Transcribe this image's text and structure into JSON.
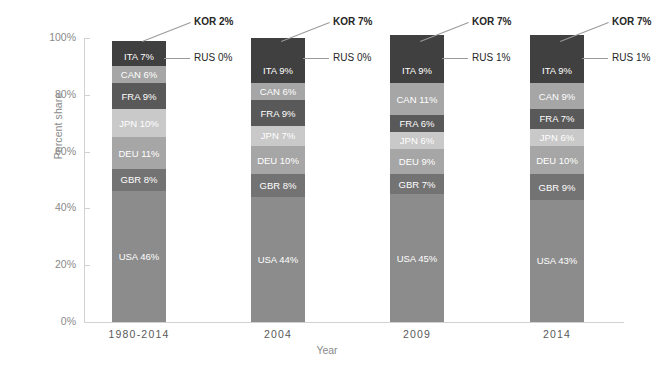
{
  "chart_data": {
    "type": "bar",
    "subtype": "stacked-percent",
    "title": "",
    "xlabel": "Year",
    "ylabel": "Percent share",
    "ylim": [
      0,
      100
    ],
    "yticks": [
      "0%",
      "20%",
      "40%",
      "60%",
      "80%",
      "100%"
    ],
    "ytick_values": [
      0,
      20,
      40,
      60,
      80,
      100
    ],
    "grid": false,
    "legend": "none (in-bar data labels)",
    "categories": [
      "1980-2014",
      "2004",
      "2009",
      "2014"
    ],
    "stack_order_bottom_to_top": [
      "USA",
      "GBR",
      "DEU",
      "JPN",
      "FRA",
      "CAN",
      "ITA",
      "RUS",
      "KOR"
    ],
    "series": [
      {
        "name": "USA",
        "values": [
          46,
          44,
          45,
          43
        ]
      },
      {
        "name": "GBR",
        "values": [
          8,
          8,
          7,
          9
        ]
      },
      {
        "name": "DEU",
        "values": [
          11,
          10,
          9,
          10
        ]
      },
      {
        "name": "JPN",
        "values": [
          10,
          7,
          6,
          6
        ]
      },
      {
        "name": "FRA",
        "values": [
          9,
          9,
          6,
          7
        ]
      },
      {
        "name": "CAN",
        "values": [
          6,
          6,
          11,
          9
        ]
      },
      {
        "name": "ITA",
        "values": [
          7,
          9,
          9,
          9
        ]
      },
      {
        "name": "RUS",
        "values": [
          0,
          0,
          1,
          1
        ]
      },
      {
        "name": "KOR",
        "values": [
          2,
          7,
          7,
          7
        ]
      }
    ],
    "bars": [
      {
        "category": "1980-2014",
        "segments": [
          {
            "code": "USA",
            "value": 46,
            "label": "USA 46%",
            "color": "#8c8c8c",
            "hatch": true,
            "inside": true
          },
          {
            "code": "GBR",
            "value": 8,
            "label": "GBR 8%",
            "color": "#737373",
            "hatch": false,
            "inside": true
          },
          {
            "code": "DEU",
            "value": 11,
            "label": "DEU 11%",
            "color": "#a6a6a6",
            "hatch": false,
            "inside": true
          },
          {
            "code": "JPN",
            "value": 10,
            "label": "JPN 10%",
            "color": "#c9c9c9",
            "hatch": false,
            "inside": true
          },
          {
            "code": "FRA",
            "value": 9,
            "label": "FRA 9%",
            "color": "#595959",
            "hatch": false,
            "inside": true
          },
          {
            "code": "CAN",
            "value": 6,
            "label": "CAN 6%",
            "color": "#a6a6a6",
            "hatch": false,
            "inside": true
          },
          {
            "code": "ITA",
            "value": 7,
            "label": "ITA 7%",
            "color": "#404040",
            "hatch": false,
            "inside": true
          },
          {
            "code": "RUS",
            "value": 0,
            "label": "RUS 0%",
            "color": "#404040",
            "hatch": false,
            "inside": false
          },
          {
            "code": "KOR",
            "value": 2,
            "label": "KOR 2%",
            "color": "#404040",
            "hatch": false,
            "inside": false
          }
        ],
        "callouts": [
          {
            "code": "KOR",
            "label": "KOR 2%",
            "bold": true
          },
          {
            "code": "RUS",
            "label": "RUS 0%",
            "bold": false
          }
        ]
      },
      {
        "category": "2004",
        "segments": [
          {
            "code": "USA",
            "value": 44,
            "label": "USA 44%",
            "color": "#8c8c8c",
            "hatch": true,
            "inside": true
          },
          {
            "code": "GBR",
            "value": 8,
            "label": "GBR 8%",
            "color": "#737373",
            "hatch": false,
            "inside": true
          },
          {
            "code": "DEU",
            "value": 10,
            "label": "DEU 10%",
            "color": "#a6a6a6",
            "hatch": false,
            "inside": true
          },
          {
            "code": "JPN",
            "value": 7,
            "label": "JPN 7%",
            "color": "#c9c9c9",
            "hatch": false,
            "inside": true
          },
          {
            "code": "FRA",
            "value": 9,
            "label": "FRA 9%",
            "color": "#595959",
            "hatch": false,
            "inside": true
          },
          {
            "code": "CAN",
            "value": 6,
            "label": "CAN 6%",
            "color": "#a6a6a6",
            "hatch": false,
            "inside": true
          },
          {
            "code": "ITA",
            "value": 9,
            "label": "ITA 9%",
            "color": "#404040",
            "hatch": false,
            "inside": true
          },
          {
            "code": "RUS",
            "value": 0,
            "label": "RUS 0%",
            "color": "#404040",
            "hatch": false,
            "inside": false
          },
          {
            "code": "KOR",
            "value": 7,
            "label": "KOR 7%",
            "color": "#404040",
            "hatch": false,
            "inside": false
          }
        ],
        "callouts": [
          {
            "code": "KOR",
            "label": "KOR 7%",
            "bold": true
          },
          {
            "code": "RUS",
            "label": "RUS 0%",
            "bold": false
          }
        ]
      },
      {
        "category": "2009",
        "segments": [
          {
            "code": "USA",
            "value": 45,
            "label": "USA 45%",
            "color": "#8c8c8c",
            "hatch": true,
            "inside": true
          },
          {
            "code": "GBR",
            "value": 7,
            "label": "GBR 7%",
            "color": "#737373",
            "hatch": false,
            "inside": true
          },
          {
            "code": "DEU",
            "value": 9,
            "label": "DEU 9%",
            "color": "#a6a6a6",
            "hatch": false,
            "inside": true
          },
          {
            "code": "JPN",
            "value": 6,
            "label": "JPN 6%",
            "color": "#c9c9c9",
            "hatch": false,
            "inside": true
          },
          {
            "code": "FRA",
            "value": 6,
            "label": "FRA 6%",
            "color": "#595959",
            "hatch": false,
            "inside": true
          },
          {
            "code": "CAN",
            "value": 11,
            "label": "CAN 11%",
            "color": "#a6a6a6",
            "hatch": false,
            "inside": true
          },
          {
            "code": "ITA",
            "value": 9,
            "label": "ITA 9%",
            "color": "#404040",
            "hatch": false,
            "inside": true
          },
          {
            "code": "RUS",
            "value": 1,
            "label": "RUS 1%",
            "color": "#404040",
            "hatch": false,
            "inside": false
          },
          {
            "code": "KOR",
            "value": 7,
            "label": "KOR 7%",
            "color": "#404040",
            "hatch": false,
            "inside": false
          }
        ],
        "callouts": [
          {
            "code": "KOR",
            "label": "KOR 7%",
            "bold": true
          },
          {
            "code": "RUS",
            "label": "RUS 1%",
            "bold": false
          }
        ]
      },
      {
        "category": "2014",
        "segments": [
          {
            "code": "USA",
            "value": 43,
            "label": "USA 43%",
            "color": "#8c8c8c",
            "hatch": true,
            "inside": true
          },
          {
            "code": "GBR",
            "value": 9,
            "label": "GBR 9%",
            "color": "#737373",
            "hatch": false,
            "inside": true
          },
          {
            "code": "DEU",
            "value": 10,
            "label": "DEU 10%",
            "color": "#a6a6a6",
            "hatch": false,
            "inside": true
          },
          {
            "code": "JPN",
            "value": 6,
            "label": "JPN 6%",
            "color": "#c9c9c9",
            "hatch": false,
            "inside": true
          },
          {
            "code": "FRA",
            "value": 7,
            "label": "FRA 7%",
            "color": "#595959",
            "hatch": false,
            "inside": true
          },
          {
            "code": "CAN",
            "value": 9,
            "label": "CAN 9%",
            "color": "#a6a6a6",
            "hatch": false,
            "inside": true
          },
          {
            "code": "ITA",
            "value": 9,
            "label": "ITA 9%",
            "color": "#404040",
            "hatch": false,
            "inside": true
          },
          {
            "code": "RUS",
            "value": 1,
            "label": "RUS 1%",
            "color": "#404040",
            "hatch": false,
            "inside": false
          },
          {
            "code": "KOR",
            "value": 7,
            "label": "KOR 7%",
            "color": "#404040",
            "hatch": false,
            "inside": false
          }
        ],
        "callouts": [
          {
            "code": "KOR",
            "label": "KOR 7%",
            "bold": true
          },
          {
            "code": "RUS",
            "label": "RUS 1%",
            "bold": false
          }
        ]
      }
    ],
    "colors": {
      "axis": "#d2d2d2",
      "axis_text": "#8a8a8a",
      "category_text": "#595959",
      "callout_text": "#262626",
      "leader_line": "#9a9a9a",
      "background": "#ffffff"
    }
  }
}
